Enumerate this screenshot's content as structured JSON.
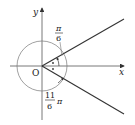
{
  "diagram": {
    "type": "angle-on-coordinate-plane",
    "axes": {
      "x_label": "x",
      "y_label": "y",
      "origin_label": "O"
    },
    "angles": [
      {
        "label_num": "π",
        "label_den": "6",
        "label_tail": "",
        "direction": "counterclockwise"
      },
      {
        "label_num": "11",
        "label_den": "6",
        "label_tail": "π",
        "direction": "counterclockwise"
      }
    ],
    "colors": {
      "line": "#333333",
      "circle": "#777777",
      "text": "#222222"
    }
  }
}
